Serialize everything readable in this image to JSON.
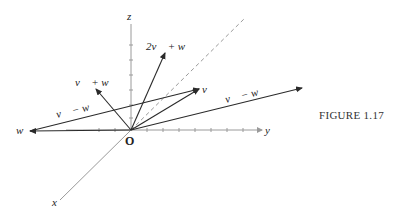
{
  "figure": {
    "caption": "FIGURE 1.17",
    "origin_label": "O",
    "axes": {
      "x_label": "x",
      "y_label": "y",
      "z_label": "z"
    },
    "vector_labels": {
      "v": "v⃗",
      "w": "w⃗",
      "v_plus_w": "v⃗ + w⃗",
      "two_v_plus_w": "2v⃗ + w⃗",
      "v_minus_w_left": "v⃗ − w⃗",
      "v_minus_w_right": "v⃗ − w⃗"
    },
    "colors": {
      "axis": "#9a9a9a",
      "vector": "#2a2a2a",
      "text": "#222222"
    }
  }
}
